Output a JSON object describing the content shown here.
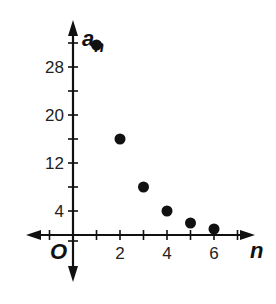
{
  "chart_data": {
    "type": "scatter",
    "title": "",
    "xlabel": "n",
    "ylabel": "a_n",
    "ylabel_main": "a",
    "ylabel_sub": "n",
    "origin_label": "O",
    "x": [
      1,
      2,
      3,
      4,
      5,
      6
    ],
    "y": [
      32,
      16,
      8,
      4,
      2,
      1
    ],
    "series": [
      {
        "name": "a_n",
        "x": [
          1,
          2,
          3,
          4,
          5,
          6
        ],
        "values": [
          32,
          16,
          8,
          4,
          2,
          1
        ]
      }
    ],
    "xlim": [
      -1,
      7
    ],
    "ylim": [
      -1,
      32
    ],
    "x_ticks": [
      -1,
      1,
      2,
      3,
      4,
      5,
      6,
      7
    ],
    "x_tick_labels": [
      {
        "value": 2,
        "label": "2"
      },
      {
        "value": 4,
        "label": "4"
      },
      {
        "value": 6,
        "label": "6"
      }
    ],
    "y_ticks": [
      -1,
      4,
      8,
      12,
      16,
      20,
      24,
      28,
      32
    ],
    "y_tick_labels": [
      {
        "value": 4,
        "label": "4"
      },
      {
        "value": 12,
        "label": "12"
      },
      {
        "value": 20,
        "label": "20"
      },
      {
        "value": 28,
        "label": "28"
      }
    ],
    "grid": false,
    "legend": "none",
    "point_color": "#111111",
    "axis_color": "#111111"
  }
}
